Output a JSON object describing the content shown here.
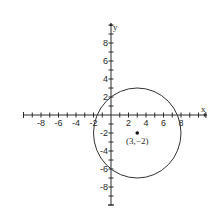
{
  "chart_data": {
    "type": "scatter",
    "title": "",
    "xlabel": "x",
    "ylabel": "y",
    "xlim": [
      -10,
      10.5
    ],
    "ylim": [
      -10,
      10
    ],
    "grid": false,
    "x_tick_values": [
      -8,
      -6,
      -4,
      -2,
      2,
      4,
      6,
      8
    ],
    "x_tick_labels": [
      "-8",
      "-6",
      "-4",
      "-2",
      "2",
      "4",
      "6",
      "8"
    ],
    "y_tick_values": [
      8,
      6,
      4,
      2,
      -2,
      -4,
      -6,
      -8
    ],
    "y_tick_labels": [
      "8",
      "6",
      "4",
      "2",
      "-2",
      "-4",
      "-6",
      "-8"
    ],
    "minor_tick_step": 1,
    "shapes": [
      {
        "kind": "circle",
        "center": [
          3,
          -2
        ],
        "radius": 5
      }
    ],
    "points": [
      {
        "x": 3,
        "y": -2,
        "label": "(3,−2)"
      }
    ]
  }
}
